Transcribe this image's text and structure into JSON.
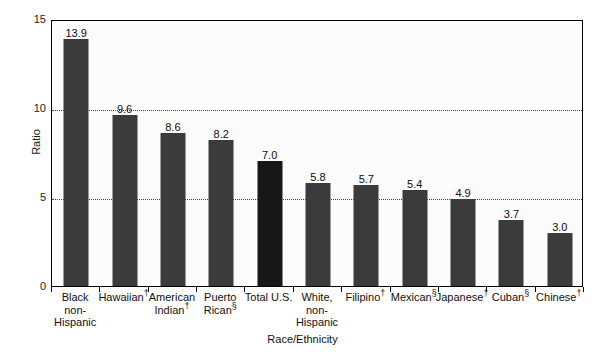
{
  "chart_data": {
    "type": "bar",
    "title": "",
    "xlabel": "Race/Ethnicity",
    "ylabel": "Ratio",
    "ylim": [
      0,
      15
    ],
    "yticks": [
      0,
      5,
      10,
      15
    ],
    "ytick_labels": [
      "0",
      "5",
      "10",
      "15"
    ],
    "grid": "horizontal-dotted at 5 and 10",
    "legend": "none",
    "categories": [
      "Black non-Hispanic",
      "Hawaiian†",
      "American Indian†",
      "Puerto Rican§",
      "Total U.S.",
      "White, non-Hispanic",
      "Filipino†",
      "Mexican§",
      "Japanese†",
      "Cuban§",
      "Chinese†"
    ],
    "values": [
      13.9,
      9.6,
      8.6,
      8.2,
      7.0,
      5.8,
      5.7,
      5.4,
      4.9,
      3.7,
      3.0
    ],
    "value_labels": [
      "13.9",
      "9.6",
      "8.6",
      "8.2",
      "7.0",
      "5.8",
      "5.7",
      "5.4",
      "4.9",
      "3.7",
      "3.0"
    ],
    "bar_color": "#3b3b3b",
    "highlight_bar_color": "#171717",
    "highlight_index": 4,
    "plot_background": "#fcfcfc",
    "frame_color": "#000000"
  },
  "bars": [
    {
      "label_lines": [
        "Black",
        "non-",
        "Hispanic"
      ],
      "marker": "",
      "value_label": "13.9",
      "value": 13.9,
      "highlight": false
    },
    {
      "label_lines": [
        "Hawaiian"
      ],
      "marker": "†",
      "value_label": "9.6",
      "value": 9.6,
      "highlight": false
    },
    {
      "label_lines": [
        "American",
        "Indian"
      ],
      "marker": "†",
      "value_label": "8.6",
      "value": 8.6,
      "highlight": false
    },
    {
      "label_lines": [
        "Puerto",
        "Rican"
      ],
      "marker": "§",
      "value_label": "8.2",
      "value": 8.2,
      "highlight": false
    },
    {
      "label_lines": [
        "Total U.S."
      ],
      "marker": "",
      "value_label": "7.0",
      "value": 7.0,
      "highlight": true
    },
    {
      "label_lines": [
        "White,",
        "non-",
        "Hispanic"
      ],
      "marker": "",
      "value_label": "5.8",
      "value": 5.8,
      "highlight": false
    },
    {
      "label_lines": [
        "Filipino"
      ],
      "marker": "†",
      "value_label": "5.7",
      "value": 5.7,
      "highlight": false
    },
    {
      "label_lines": [
        "Mexican"
      ],
      "marker": "§",
      "value_label": "5.4",
      "value": 5.4,
      "highlight": false
    },
    {
      "label_lines": [
        "Japanese"
      ],
      "marker": "†",
      "value_label": "4.9",
      "value": 4.9,
      "highlight": false
    },
    {
      "label_lines": [
        "Cuban"
      ],
      "marker": "§",
      "value_label": "3.7",
      "value": 3.7,
      "highlight": false
    },
    {
      "label_lines": [
        "Chinese"
      ],
      "marker": "†",
      "value_label": "3.0",
      "value": 3.0,
      "highlight": false
    }
  ],
  "axes": {
    "y_title": "Ratio",
    "x_title": "Race/Ethnicity",
    "y_ticks": [
      "15",
      "10",
      "5",
      "0"
    ]
  }
}
